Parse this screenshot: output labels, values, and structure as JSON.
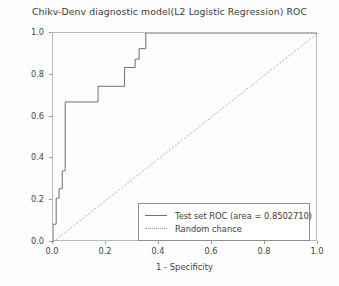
{
  "chart_data": {
    "type": "line",
    "title": "Chikv-Denv diagnostic model(L2 Logistic Regression) ROC",
    "xlabel": "1 - Specificity",
    "ylabel": "Sensitivity",
    "xlim": [
      0.0,
      1.0
    ],
    "ylim": [
      0.0,
      1.0
    ],
    "xticks": [
      "0.0",
      "0.2",
      "0.4",
      "0.6",
      "0.8",
      "1.0"
    ],
    "xtick_values": [
      0.0,
      0.2,
      0.4,
      0.6,
      0.8,
      1.0
    ],
    "yticks": [
      "0.0",
      "0.2",
      "0.4",
      "0.6",
      "0.8",
      "1.0"
    ],
    "ytick_values": [
      0.0,
      0.2,
      0.4,
      0.6,
      0.8,
      1.0
    ],
    "grid": false,
    "legend_position": "lower right",
    "auc": 0.850271,
    "series": [
      {
        "name": "Test set ROC (area = 0.8502710)",
        "style": "step-solid",
        "color": "#6f6f6f",
        "x": [
          0.0,
          0.0,
          0.012,
          0.012,
          0.023,
          0.023,
          0.035,
          0.035,
          0.046,
          0.046,
          0.17,
          0.17,
          0.27,
          0.27,
          0.31,
          0.31,
          0.325,
          0.325,
          0.35,
          0.35,
          0.4,
          1.0
        ],
        "y": [
          0.0,
          0.085,
          0.085,
          0.21,
          0.21,
          0.255,
          0.255,
          0.34,
          0.34,
          0.67,
          0.67,
          0.745,
          0.745,
          0.835,
          0.835,
          0.875,
          0.875,
          0.925,
          0.925,
          1.0,
          1.0,
          1.0
        ]
      },
      {
        "name": "Random chance",
        "style": "dotted",
        "color": "#9b9b9b",
        "x": [
          0.0,
          1.0
        ],
        "y": [
          0.0,
          1.0
        ]
      }
    ]
  },
  "legend": {
    "items": [
      {
        "label": "Test set ROC (area = 0.8502710)",
        "swatch": "solid-line-swatch"
      },
      {
        "label": "Random chance",
        "swatch": "dotted-line-swatch"
      }
    ]
  }
}
